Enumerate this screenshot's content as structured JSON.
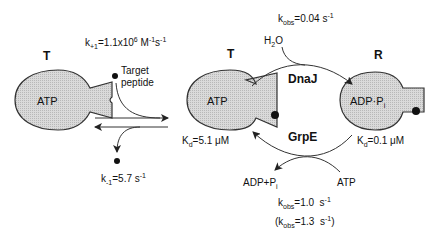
{
  "states": {
    "left": {
      "label": "T",
      "nucleotide": "ATP"
    },
    "middle": {
      "label": "T",
      "nucleotide": "ATP",
      "kd_prefix": "K",
      "kd_sub": "d",
      "kd_value": "=5.1 μM"
    },
    "right": {
      "label": "R",
      "nucleotide_a": "ADP·P",
      "nucleotide_sub": "i",
      "kd_prefix": "K",
      "kd_sub": "d",
      "kd_value": "=0.1 μM"
    }
  },
  "binding": {
    "kon_prefix": "k",
    "kon_sub": "+1",
    "kon_value": "=1.1x10",
    "kon_exp": "6",
    "kon_unit1": " M",
    "kon_unit1_exp": "-1",
    "kon_unit2": "s",
    "kon_unit2_exp": "-1",
    "peptide_label_1": "Target",
    "peptide_label_2": "peptide",
    "koff_prefix": "k",
    "koff_sub": "-1",
    "koff_value": "=5.7 s",
    "koff_exp": "-1"
  },
  "hydrolysis": {
    "kobs_prefix": "k",
    "kobs_sub": "obs",
    "kobs_value": "=0.04 s",
    "kobs_exp": "-1",
    "water_a": "H",
    "water_sub": "2",
    "water_b": "O",
    "cofactor": "DnaJ"
  },
  "exchange": {
    "cofactor": "GrpE",
    "product_a": "ADP+P",
    "product_sub": "i",
    "substrate": "ATP",
    "kobs1_prefix": "k",
    "kobs1_sub": "obs",
    "kobs1_value": "=1.0  s",
    "kobs1_exp": "-1",
    "kobs2_open": "(k",
    "kobs2_sub": "obs",
    "kobs2_value": "=1.3  s",
    "kobs2_exp": "-1",
    "kobs2_close": ")"
  },
  "colors": {
    "protein_fill": "#d4d4d4",
    "stroke": "#333333",
    "ink": "#111111"
  }
}
